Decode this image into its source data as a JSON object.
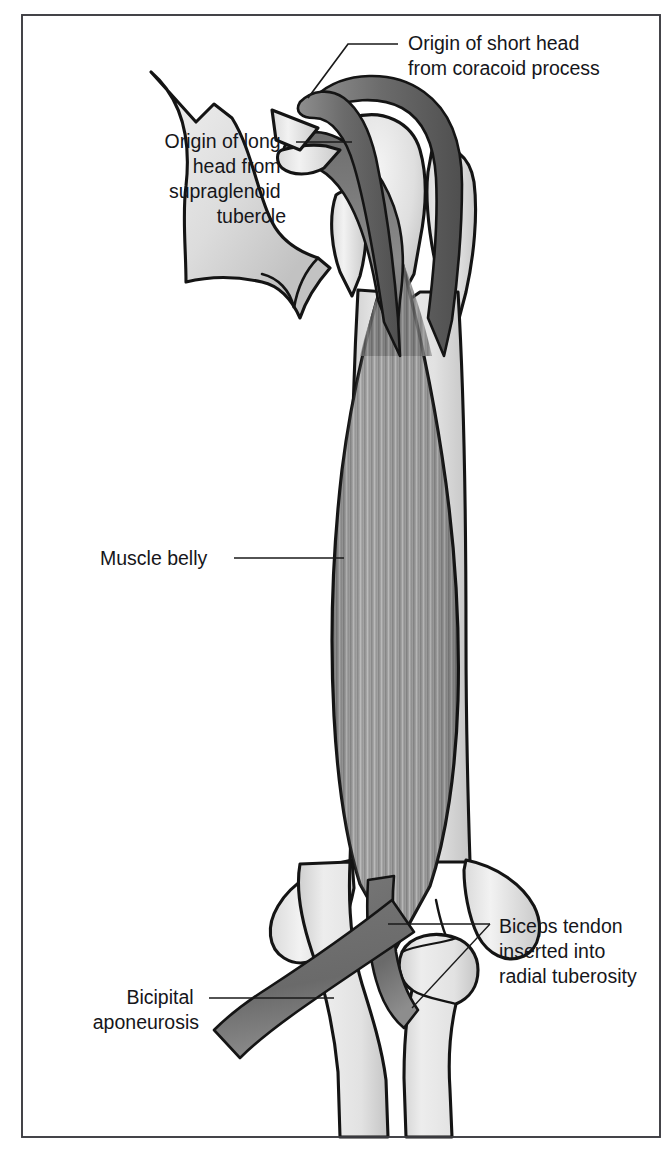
{
  "figure": {
    "background_color": "#ffffff",
    "frame_color": "#3b3b40",
    "labels": [
      {
        "id": "origin-short-head",
        "lines": [
          "Origin of short head",
          "from coracoid process"
        ],
        "text_anchor": "start",
        "text_x": 408,
        "text_y": 50,
        "line_height": 25
      },
      {
        "id": "origin-long-head",
        "lines": [
          "Origin of long",
          "head from",
          "supraglenoid",
          "tubercle"
        ],
        "text_anchor": "end",
        "text_x": 286,
        "text_y": 148,
        "line_height": 25
      },
      {
        "id": "muscle-belly",
        "lines": [
          "Muscle belly"
        ],
        "text_anchor": "start",
        "text_x": 100,
        "text_y": 565,
        "line_height": 25
      },
      {
        "id": "biceps-tendon",
        "lines": [
          "Biceps tendon",
          "inserted into",
          "radial tuberosity"
        ],
        "text_anchor": "start",
        "text_x": 499,
        "text_y": 933,
        "line_height": 25
      },
      {
        "id": "bicipital-aponeurosis",
        "lines": [
          "Bicipital",
          "aponeurosis"
        ],
        "text_anchor": "end",
        "text_x": 199,
        "text_y": 1004,
        "line_height": 25
      }
    ],
    "colors": {
      "bone_light": "#f0f0f0",
      "bone_mid": "#d8d8d8",
      "bone_shade": "#bcbcbc",
      "muscle_mid": "#9a9a9a",
      "muscle_dark": "#6f6f6f",
      "tendon": "#7a7a7a",
      "tendon_dark": "#5a5a5a",
      "outline": "#141414",
      "text": "#16161a"
    },
    "structures": [
      "scapula with acromion and spine",
      "coracoid process",
      "humeral head with greater and lesser tubercles",
      "humerus shaft",
      "long head of biceps tendon",
      "short head of biceps tendon",
      "biceps brachii muscle belly",
      "distal biceps tendon",
      "bicipital aponeurosis",
      "radius with radial tuberosity",
      "ulna"
    ]
  }
}
